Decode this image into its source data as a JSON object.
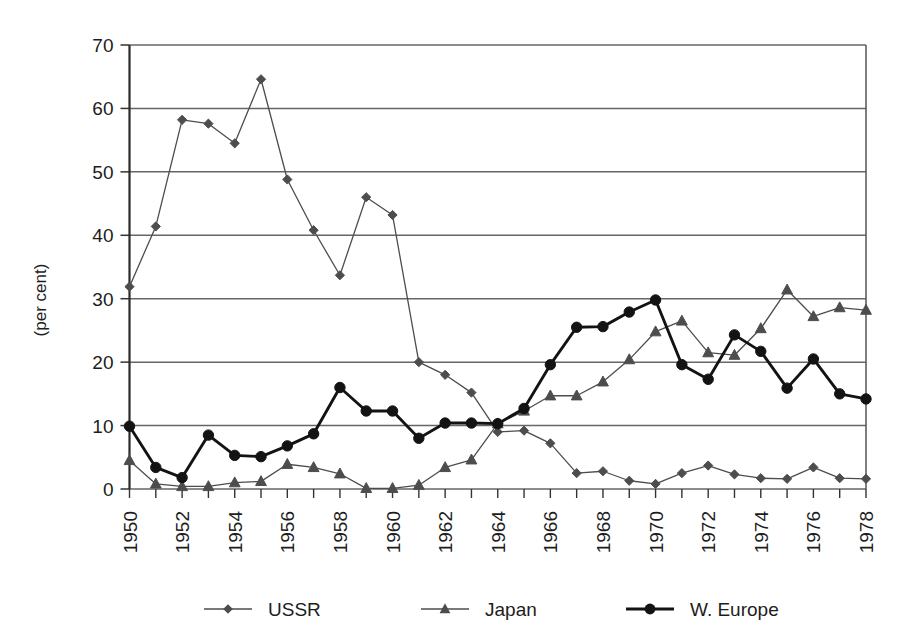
{
  "chart_data": {
    "type": "line",
    "title": "",
    "subtitle": "",
    "xlabel": "",
    "ylabel": "(per cent)",
    "ylim": [
      0,
      70
    ],
    "ytick_step": 10,
    "yticks": [
      "0",
      "10",
      "20",
      "30",
      "40",
      "50",
      "60",
      "70"
    ],
    "grid": "horizontal",
    "legend_position": "bottom",
    "x": [
      1950,
      1951,
      1952,
      1953,
      1954,
      1955,
      1956,
      1957,
      1958,
      1959,
      1960,
      1961,
      1962,
      1963,
      1964,
      1965,
      1966,
      1967,
      1968,
      1969,
      1970,
      1971,
      1972,
      1973,
      1974,
      1975,
      1976,
      1977,
      1978
    ],
    "xtick_labels": [
      "1950",
      "1952",
      "1954",
      "1956",
      "1958",
      "1960",
      "1962",
      "1964",
      "1966",
      "1968",
      "1970",
      "1972",
      "1974",
      "1976",
      "1978"
    ],
    "xtick_years": [
      1950,
      1952,
      1954,
      1956,
      1958,
      1960,
      1962,
      1964,
      1966,
      1968,
      1970,
      1972,
      1974,
      1976,
      1978
    ],
    "xlim": [
      1950,
      1978
    ],
    "series": [
      {
        "name": "USSR",
        "marker": "diamond",
        "color": "#4d4d4d",
        "line_width": 1.3,
        "values": [
          31.9,
          41.4,
          58.2,
          57.6,
          54.5,
          64.6,
          48.8,
          40.8,
          33.7,
          46.0,
          43.2,
          20.0,
          18.0,
          15.2,
          9.0,
          9.2,
          7.2,
          2.5,
          2.8,
          1.3,
          0.8,
          2.5,
          3.7,
          2.3,
          1.7,
          1.6,
          3.4,
          1.7,
          1.6
        ]
      },
      {
        "name": "Japan",
        "marker": "triangle",
        "color": "#4d4d4d",
        "line_width": 1.3,
        "values": [
          4.5,
          0.8,
          0.4,
          0.4,
          1.0,
          1.2,
          3.9,
          3.4,
          2.4,
          0.1,
          0.1,
          0.6,
          3.4,
          4.6,
          10.3,
          12.3,
          14.7,
          14.7,
          16.9,
          20.4,
          24.8,
          26.5,
          21.5,
          21.1,
          25.3,
          31.4,
          27.2,
          28.6,
          28.2
        ]
      },
      {
        "name": "W. Europe",
        "marker": "circle",
        "color": "#131313",
        "line_width": 2.9,
        "values": [
          9.9,
          3.4,
          1.8,
          8.5,
          5.3,
          5.1,
          6.8,
          8.7,
          16.0,
          12.3,
          12.3,
          8.0,
          10.4,
          10.4,
          10.3,
          12.7,
          19.6,
          25.5,
          25.6,
          27.9,
          29.8,
          19.6,
          17.3,
          24.3,
          21.7,
          15.9,
          20.5,
          15.0,
          14.2
        ]
      }
    ],
    "legend": [
      {
        "label": "USSR",
        "marker": "diamond"
      },
      {
        "label": "Japan",
        "marker": "triangle"
      },
      {
        "label": "W. Europe",
        "marker": "circle"
      }
    ]
  }
}
